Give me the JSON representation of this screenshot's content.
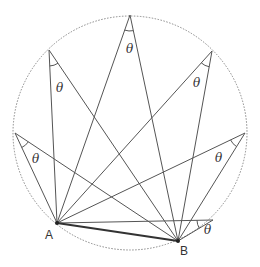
{
  "diagram": {
    "circle": {
      "cx": 130,
      "cy": 133,
      "r": 117,
      "style": "dashed"
    },
    "chord": {
      "from": "A",
      "to": "B"
    },
    "points": {
      "A": {
        "label": "A",
        "x": 57,
        "y": 223
      },
      "B": {
        "label": "B",
        "x": 178,
        "y": 241
      }
    },
    "angle_symbol": "θ",
    "vertices": [
      {
        "x": 15,
        "y": 133,
        "theta_x": 32,
        "theta_y": 163
      },
      {
        "x": 49,
        "y": 50,
        "theta_x": 56,
        "theta_y": 92
      },
      {
        "x": 130,
        "y": 15,
        "theta_x": 126,
        "theta_y": 53
      },
      {
        "x": 212,
        "y": 51,
        "theta_x": 193,
        "theta_y": 87
      },
      {
        "x": 245,
        "y": 133,
        "theta_x": 215,
        "theta_y": 162
      },
      {
        "x": 213,
        "y": 220,
        "theta_x": 204,
        "theta_y": 234
      }
    ],
    "colors": {
      "line": "#555555",
      "chord": "#333333",
      "circle": "#888888"
    }
  }
}
